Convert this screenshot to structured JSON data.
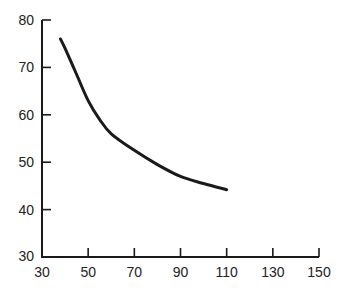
{
  "chart_data": {
    "type": "line",
    "title": "",
    "xlabel": "",
    "ylabel": "",
    "xlim": [
      30,
      150
    ],
    "ylim": [
      30,
      80
    ],
    "x_ticks": [
      30,
      50,
      70,
      90,
      110,
      130,
      150
    ],
    "y_ticks": [
      30,
      40,
      50,
      60,
      70,
      80
    ],
    "grid": false,
    "legend": null,
    "series": [
      {
        "name": "curve",
        "color": "#1a1a1a",
        "x": [
          38,
          40,
          45,
          50,
          55,
          60,
          70,
          80,
          90,
          100,
          110
        ],
        "y": [
          76,
          74,
          68.5,
          63,
          59,
          56,
          52.5,
          49.5,
          47,
          45.5,
          44.2
        ]
      }
    ]
  }
}
